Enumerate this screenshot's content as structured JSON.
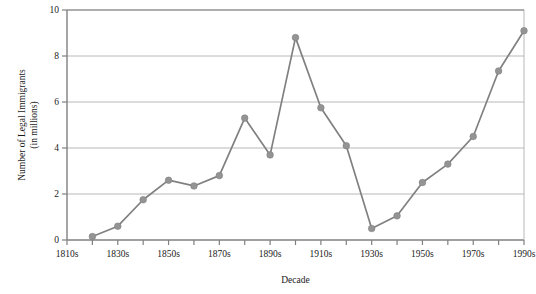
{
  "chart_data": {
    "type": "line",
    "title": "",
    "xlabel": "Decade",
    "ylabel": "Number of Legal Immigrants\n(in millions)",
    "ylabel_line1": "Number of Legal Immigrants",
    "ylabel_line2": "(in millions)",
    "categories": [
      "1810s",
      "1820s",
      "1830s",
      "1840s",
      "1850s",
      "1860s",
      "1870s",
      "1880s",
      "1890s",
      "1900s",
      "1910s",
      "1920s",
      "1930s",
      "1940s",
      "1950s",
      "1960s",
      "1970s",
      "1980s",
      "1990s"
    ],
    "x_tick_labels": [
      "1810s",
      "",
      "1830s",
      "",
      "1850s",
      "",
      "1870s",
      "",
      "1890s",
      "",
      "1910s",
      "",
      "1930s",
      "",
      "1950s",
      "",
      "1970s",
      "",
      "1990s"
    ],
    "values": [
      null,
      0.15,
      0.6,
      1.75,
      2.6,
      2.35,
      2.8,
      5.3,
      3.7,
      8.8,
      5.75,
      4.1,
      0.5,
      1.05,
      2.5,
      3.3,
      4.5,
      7.35,
      9.1
    ],
    "series": [
      {
        "name": "Legal Immigrants",
        "points": [
          {
            "x": "1820s",
            "y": 0.15
          },
          {
            "x": "1830s",
            "y": 0.6
          },
          {
            "x": "1840s",
            "y": 1.75
          },
          {
            "x": "1850s",
            "y": 2.6
          },
          {
            "x": "1860s",
            "y": 2.35
          },
          {
            "x": "1870s",
            "y": 2.8
          },
          {
            "x": "1880s",
            "y": 5.3
          },
          {
            "x": "1890s",
            "y": 3.7
          },
          {
            "x": "1900s",
            "y": 8.8
          },
          {
            "x": "1910s",
            "y": 5.75
          },
          {
            "x": "1920s",
            "y": 4.1
          },
          {
            "x": "1930s",
            "y": 0.5
          },
          {
            "x": "1940s",
            "y": 1.05
          },
          {
            "x": "1950s",
            "y": 2.5
          },
          {
            "x": "1960s",
            "y": 3.3
          },
          {
            "x": "1970s",
            "y": 4.5
          },
          {
            "x": "1980s",
            "y": 7.35
          },
          {
            "x": "1990s",
            "y": 9.1
          }
        ]
      }
    ],
    "y_ticks": [
      0,
      2,
      4,
      6,
      8,
      10
    ],
    "y_tick_labels": [
      "0",
      "2",
      "4",
      "6",
      "8",
      "10"
    ],
    "ylim": [
      0,
      10
    ],
    "grid": "horizontal",
    "legend": "none",
    "line_color": "#808080",
    "marker_color": "#949494",
    "grid_color": "#b0b0b0",
    "axis_color": "#808080",
    "text_color": "#1a1a1a"
  }
}
